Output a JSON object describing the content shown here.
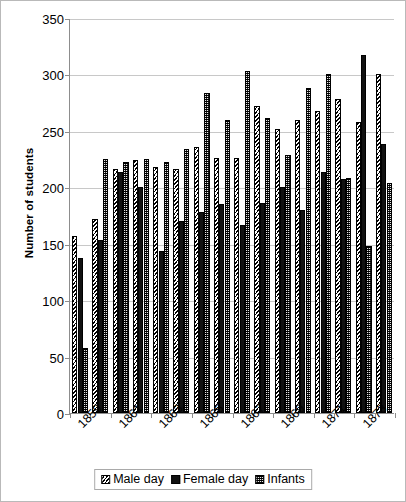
{
  "chart_data": {
    "type": "bar",
    "title": "",
    "xlabel": "",
    "ylabel": "Number of students",
    "ylim": [
      0,
      350
    ],
    "yticks": [
      0,
      50,
      100,
      150,
      200,
      250,
      300,
      350
    ],
    "grid": true,
    "legend_position": "bottom-center",
    "categories": [
      "1859",
      "1860",
      "1861",
      "1862",
      "1863",
      "1864",
      "1865",
      "1866",
      "1867",
      "1868",
      "1869",
      "1870",
      "1871",
      "1872",
      "1873",
      "1874"
    ],
    "visible_tick_labels": [
      "1859",
      "1861",
      "1863",
      "1865",
      "1867",
      "1869",
      "1871",
      "1873"
    ],
    "series": [
      {
        "name": "Male day",
        "pattern": "diagonal-hatch",
        "color": "#000000",
        "values": [
          157,
          172,
          216,
          224,
          218,
          216,
          236,
          226,
          226,
          272,
          252,
          260,
          268,
          278,
          258,
          300
        ]
      },
      {
        "name": "Female day",
        "pattern": "solid",
        "color": "#111111",
        "values": [
          137,
          153,
          214,
          200,
          144,
          170,
          178,
          185,
          167,
          186,
          200,
          180,
          214,
          207,
          317,
          238
        ]
      },
      {
        "name": "Infants",
        "pattern": "checker-dot",
        "color": "#5f5f5f",
        "values": [
          58,
          225,
          222,
          225,
          222,
          234,
          284,
          260,
          303,
          261,
          229,
          288,
          300,
          208,
          148,
          204
        ]
      }
    ]
  },
  "legend": {
    "items": [
      {
        "label": "Male day",
        "icon": "hatch-swatch-icon"
      },
      {
        "label": "Female day",
        "icon": "solid-swatch-icon"
      },
      {
        "label": "Infants",
        "icon": "checker-swatch-icon"
      }
    ]
  }
}
